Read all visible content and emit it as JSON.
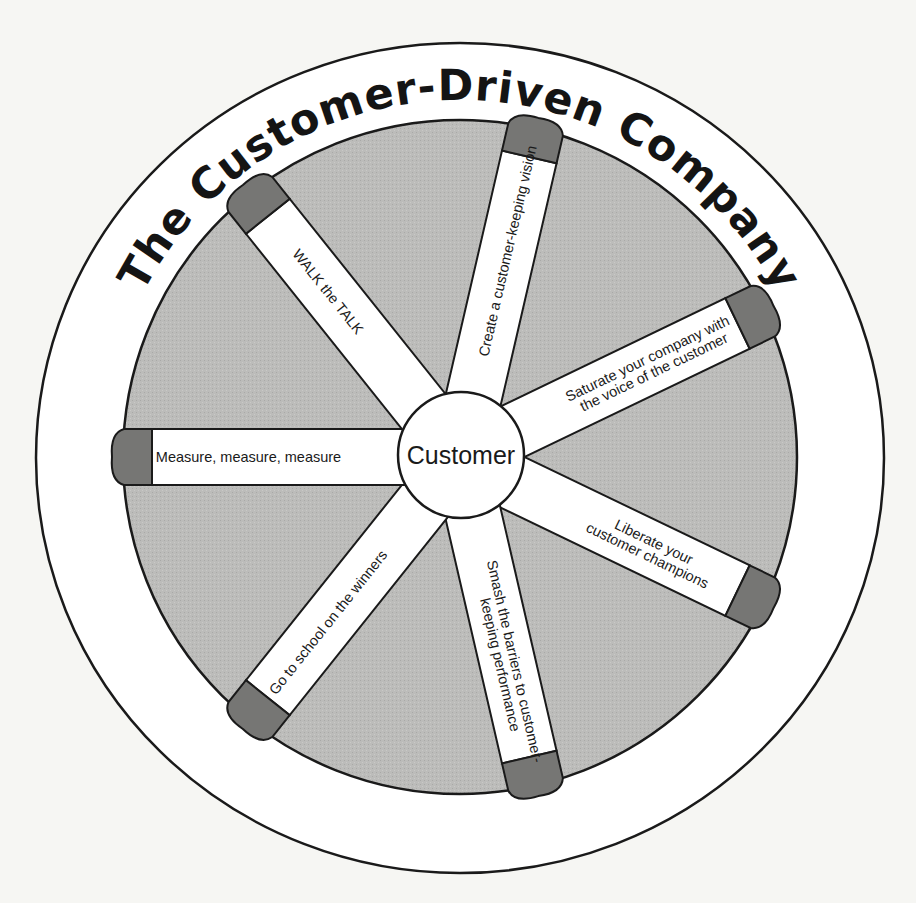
{
  "diagram": {
    "title": "The Customer-Driven Company",
    "hub": {
      "label": "Customer"
    },
    "spokes": [
      {
        "label_lines": [
          "Create a customer-keeping vision"
        ],
        "angle_deg": -77,
        "text_rotation": -77
      },
      {
        "label_lines": [
          "Saturate your company with",
          "the voice of the customer"
        ],
        "angle_deg": -25.7,
        "text_rotation": -25.7
      },
      {
        "label_lines": [
          "Liberate your",
          "customer champions"
        ],
        "angle_deg": 25.7,
        "text_rotation": 25.7
      },
      {
        "label_lines": [
          "Smash the barriers to customer-",
          "keeping performance"
        ],
        "angle_deg": 77,
        "text_rotation": 77
      },
      {
        "label_lines": [
          "Go to school on the winners"
        ],
        "angle_deg": 128.6,
        "text_rotation": -51.4
      },
      {
        "label_lines": [
          "Measure, measure, measure"
        ],
        "angle_deg": 180,
        "text_rotation": 0
      },
      {
        "label_lines": [
          "WALK the TALK"
        ],
        "angle_deg": -128.6,
        "text_rotation": 51.4
      }
    ],
    "colors": {
      "background": "#f6f6f3",
      "outer_ring": "#ffffff",
      "wheel_fill": "#b9b9b7",
      "spoke_fill": "#ffffff",
      "cap_fill": "#767674",
      "stroke": "#1a1a1a"
    }
  }
}
